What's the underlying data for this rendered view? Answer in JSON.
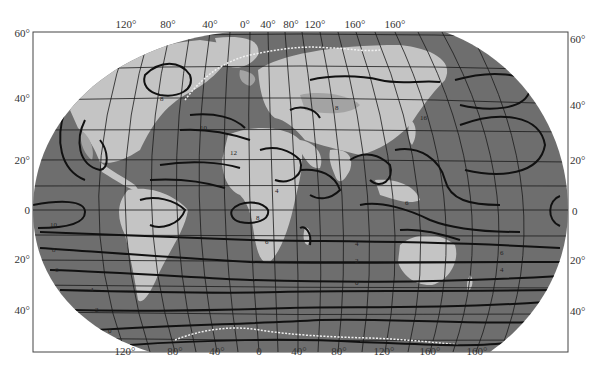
{
  "map": {
    "title": "World map with isoline contours (Robinson-like projection)",
    "colors": {
      "ocean": "#6e6e6e",
      "land": "#c4c4c4",
      "land_high": "#a3a3a3",
      "contour": "#111111",
      "graticule": "#1a1a1a",
      "ice_edge": "#f0f0f0",
      "frame": "#444444",
      "background": "#ffffff"
    },
    "frame": {
      "left": 33,
      "top": 32,
      "right": 568,
      "bottom": 352
    },
    "top_longitude_labels": [
      {
        "text": "120°",
        "x": 126
      },
      {
        "text": "80°",
        "x": 168
      },
      {
        "text": "40°",
        "x": 210
      },
      {
        "text": "0°",
        "x": 245
      },
      {
        "text": "40°",
        "x": 266
      },
      {
        "text": "80°",
        "x": 289
      },
      {
        "text": "120°",
        "x": 313
      },
      {
        "text": "160°",
        "x": 352
      },
      {
        "text": "160°",
        "x": 392
      }
    ],
    "bottom_longitude_labels": [
      {
        "text": "120°",
        "x": 125
      },
      {
        "text": "80°",
        "x": 175
      },
      {
        "text": "40°",
        "x": 217
      },
      {
        "text": "0",
        "x": 259
      },
      {
        "text": "40°",
        "x": 298
      },
      {
        "text": "80°",
        "x": 338
      },
      {
        "text": "120°",
        "x": 385
      },
      {
        "text": "160°",
        "x": 430
      },
      {
        "text": "160°",
        "x": 476
      }
    ],
    "left_latitude_labels": [
      {
        "text": "60°",
        "y": 33
      },
      {
        "text": "40°",
        "y": 98
      },
      {
        "text": "20°",
        "y": 160
      },
      {
        "text": "0",
        "y": 209
      },
      {
        "text": "20°",
        "y": 258
      },
      {
        "text": "40°",
        "y": 310
      }
    ],
    "right_latitude_labels": [
      {
        "text": "60°",
        "y": 38
      },
      {
        "text": "40°",
        "y": 105
      },
      {
        "text": "20°",
        "y": 160
      },
      {
        "text": "0",
        "y": 211
      },
      {
        "text": "20°",
        "y": 260
      },
      {
        "text": "40°",
        "y": 311
      }
    ],
    "contour_values": [
      "0",
      "2",
      "4",
      "6",
      "8",
      "10",
      "12",
      "16"
    ]
  }
}
